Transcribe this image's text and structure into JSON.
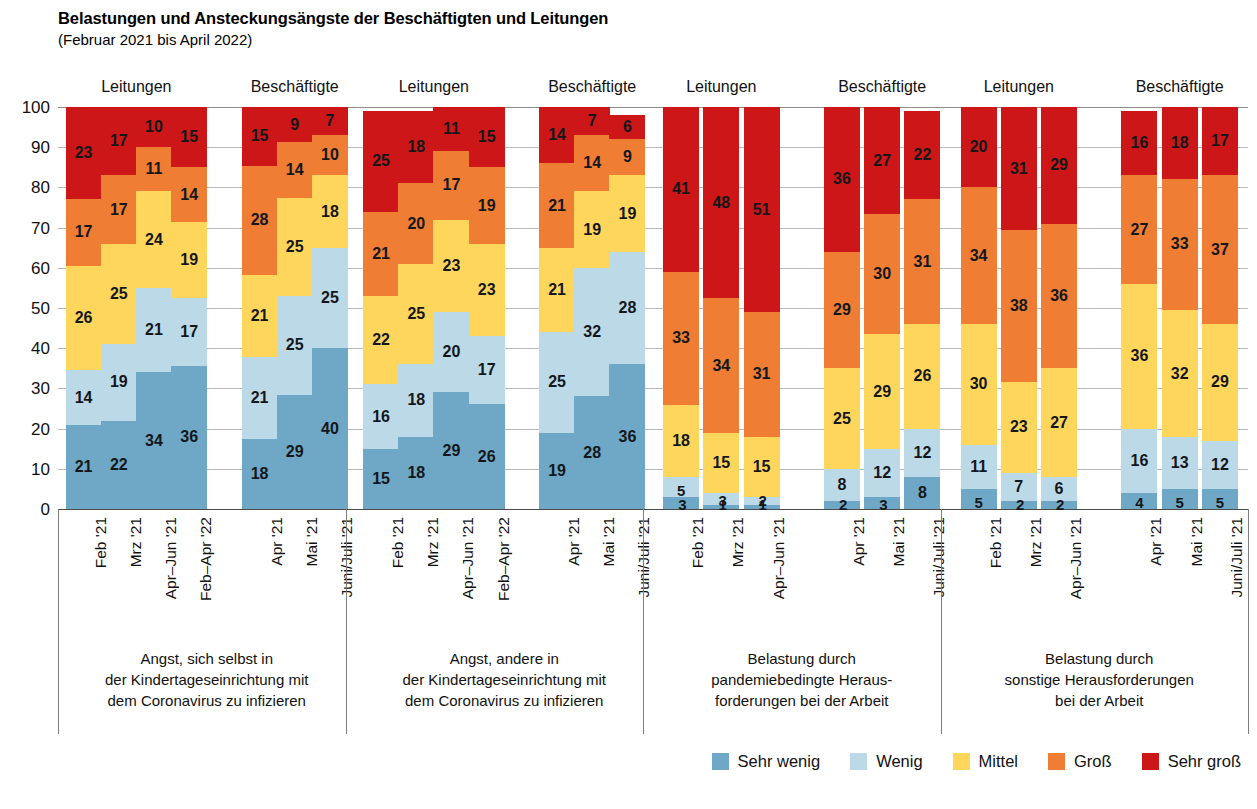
{
  "header": {
    "title": "Belastungen und Ansteckungsängste der Beschäftigten und Leitungen",
    "subtitle": "(Februar 2021 bis April 2022)"
  },
  "chart_data": {
    "type": "bar",
    "subtype": "stacked-percentage",
    "title": "Belastungen und Ansteckungsängste der Beschäftigten und Leitungen",
    "subtitle": "(Februar 2021 bis April 2022)",
    "xlabel": "",
    "ylabel": "",
    "ylim": [
      0,
      100
    ],
    "yticks": [
      "0",
      "10",
      "20",
      "30",
      "40",
      "50",
      "60",
      "70",
      "80",
      "90",
      "100"
    ],
    "grid": true,
    "legend_position": "bottom-right",
    "series": [
      {
        "name": "Sehr wenig",
        "color": "#6fa8c6"
      },
      {
        "name": "Wenig",
        "color": "#bcd9e8"
      },
      {
        "name": "Mittel",
        "color": "#ffd65c"
      },
      {
        "name": "Groß",
        "color": "#ef7d33"
      },
      {
        "name": "Sehr groß",
        "color": "#cc1618"
      }
    ],
    "panels": [
      {
        "caption": [
          "Angst, sich selbst in",
          "der Kindertageseinrichtung mit",
          "dem Coronavirus zu infizieren"
        ],
        "subgroups": [
          {
            "label": "Leitungen",
            "bars": [
              {
                "x": "Feb '21",
                "values": [
                  21,
                  14,
                  26,
                  17,
                  23
                ]
              },
              {
                "x": "Mrz '21",
                "values": [
                  22,
                  19,
                  25,
                  17,
                  17
                ]
              },
              {
                "x": "Apr–Jun '21",
                "values": [
                  34,
                  21,
                  24,
                  11,
                  10
                ]
              },
              {
                "x": "Feb–Apr '22",
                "values": [
                  36,
                  17,
                  19,
                  14,
                  15
                ]
              }
            ]
          },
          {
            "label": "Beschäftigte",
            "bars": [
              {
                "x": "Apr '21",
                "values": [
                  18,
                  21,
                  21,
                  28,
                  15
                ]
              },
              {
                "x": "Mai '21",
                "values": [
                  29,
                  25,
                  25,
                  14,
                  9
                ]
              },
              {
                "x": "Juni/Juli '21",
                "values": [
                  40,
                  25,
                  18,
                  10,
                  7
                ]
              }
            ]
          }
        ]
      },
      {
        "caption": [
          "Angst, andere in",
          "der Kindertageseinrichtung mit",
          "dem Coronavirus zu infizieren"
        ],
        "subgroups": [
          {
            "label": "Leitungen",
            "bars": [
              {
                "x": "Feb '21",
                "values": [
                  15,
                  16,
                  22,
                  21,
                  25
                ]
              },
              {
                "x": "Mrz '21",
                "values": [
                  18,
                  18,
                  25,
                  20,
                  18
                ]
              },
              {
                "x": "Apr–Jun '21",
                "values": [
                  29,
                  20,
                  23,
                  17,
                  11
                ]
              },
              {
                "x": "Feb–Apr '22",
                "values": [
                  26,
                  17,
                  23,
                  19,
                  15
                ]
              }
            ]
          },
          {
            "label": "Beschäftigte",
            "bars": [
              {
                "x": "Apr '21",
                "values": [
                  19,
                  25,
                  21,
                  21,
                  14
                ]
              },
              {
                "x": "Mai '21",
                "values": [
                  28,
                  32,
                  19,
                  14,
                  7
                ]
              },
              {
                "x": "Juni/Juli '21",
                "values": [
                  36,
                  28,
                  19,
                  9,
                  6
                ]
              }
            ]
          }
        ]
      },
      {
        "caption": [
          "Belastung durch",
          "pandemiebedingte Heraus-",
          "forderungen bei der Arbeit"
        ],
        "subgroups": [
          {
            "label": "Leitungen",
            "bars": [
              {
                "x": "Feb '21",
                "values": [
                  3,
                  5,
                  18,
                  33,
                  41
                ]
              },
              {
                "x": "Mrz '21",
                "values": [
                  1,
                  3,
                  15,
                  34,
                  48
                ]
              },
              {
                "x": "Apr–Jun '21",
                "values": [
                  1,
                  2,
                  15,
                  31,
                  51
                ]
              }
            ]
          },
          {
            "label": "Beschäftigte",
            "bars": [
              {
                "x": "Apr '21",
                "values": [
                  2,
                  8,
                  25,
                  29,
                  36
                ]
              },
              {
                "x": "Mai '21",
                "values": [
                  3,
                  12,
                  29,
                  30,
                  27
                ]
              },
              {
                "x": "Juni/Juli '21",
                "values": [
                  8,
                  12,
                  26,
                  31,
                  22
                ]
              }
            ]
          }
        ]
      },
      {
        "caption": [
          "Belastung durch",
          "sonstige Herausforderungen",
          "bei der Arbeit"
        ],
        "subgroups": [
          {
            "label": "Leitungen",
            "bars": [
              {
                "x": "Feb '21",
                "values": [
                  5,
                  11,
                  30,
                  34,
                  20
                ]
              },
              {
                "x": "Mrz '21",
                "values": [
                  2,
                  7,
                  23,
                  38,
                  31
                ]
              },
              {
                "x": "Apr–Jun '21",
                "values": [
                  2,
                  6,
                  27,
                  36,
                  29
                ]
              }
            ]
          },
          {
            "label": "Beschäftigte",
            "bars": [
              {
                "x": "Apr '21",
                "values": [
                  4,
                  16,
                  36,
                  27,
                  16
                ]
              },
              {
                "x": "Mai '21",
                "values": [
                  5,
                  13,
                  32,
                  33,
                  18
                ]
              },
              {
                "x": "Juni/Juli '21",
                "values": [
                  5,
                  12,
                  29,
                  37,
                  17
                ]
              }
            ]
          }
        ]
      }
    ]
  }
}
